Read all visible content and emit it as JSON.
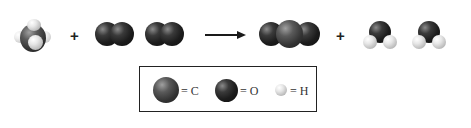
{
  "diagram": {
    "reactants": [
      {
        "name": "methane",
        "formula": "CH4",
        "atoms": [
          "C",
          "H",
          "H",
          "H",
          "H"
        ]
      },
      {
        "name": "oxygen",
        "formula": "O2",
        "atoms": [
          "O",
          "O"
        ]
      },
      {
        "name": "oxygen",
        "formula": "O2",
        "atoms": [
          "O",
          "O"
        ]
      }
    ],
    "products": [
      {
        "name": "carbon-dioxide",
        "formula": "CO2",
        "atoms": [
          "O",
          "C",
          "O"
        ]
      },
      {
        "name": "water",
        "formula": "H2O",
        "atoms": [
          "O",
          "H",
          "H"
        ]
      },
      {
        "name": "water",
        "formula": "H2O",
        "atoms": [
          "O",
          "H",
          "H"
        ]
      }
    ],
    "operators": {
      "plus1": "+",
      "plus2": "+",
      "arrow": "→"
    },
    "colors": {
      "carbon": "#4a4a4a",
      "oxygen": "#1c1c1c",
      "hydrogen": "#d8d8d8",
      "border": "#222222"
    }
  },
  "legend": {
    "items": [
      {
        "symbol": "C",
        "label": "= C"
      },
      {
        "symbol": "O",
        "label": "= O"
      },
      {
        "symbol": "H",
        "label": "= H"
      }
    ]
  }
}
